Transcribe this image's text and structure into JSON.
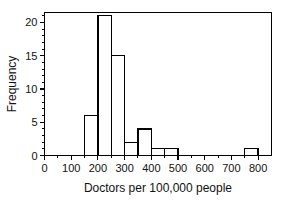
{
  "chart_data": {
    "type": "bar",
    "title": "",
    "subtitle": "",
    "xlabel": "Doctors per 100,000 people",
    "ylabel": "Frequency",
    "xlim": [
      0,
      850
    ],
    "ylim": [
      0,
      21.5
    ],
    "grid": false,
    "legend": null,
    "bin_width": 50,
    "xticks": [
      0,
      100,
      200,
      300,
      400,
      500,
      600,
      700,
      800
    ],
    "xtick_labels": [
      "0",
      "100",
      "200",
      "300",
      "400",
      "500",
      "600",
      "700",
      "800"
    ],
    "xticks_minor": [
      50,
      150,
      250,
      350,
      450,
      550,
      650,
      750
    ],
    "yticks": [
      0,
      5,
      10,
      15,
      20
    ],
    "ytick_labels": [
      "0",
      "5",
      "10",
      "15",
      "20"
    ],
    "yticks_minor": [
      1,
      2,
      3,
      4,
      6,
      7,
      8,
      9,
      11,
      12,
      13,
      14,
      16,
      17,
      18,
      19,
      21
    ],
    "bins": [
      {
        "start": 150,
        "end": 200,
        "value": 6
      },
      {
        "start": 200,
        "end": 250,
        "value": 21
      },
      {
        "start": 250,
        "end": 300,
        "value": 15
      },
      {
        "start": 300,
        "end": 350,
        "value": 2
      },
      {
        "start": 350,
        "end": 400,
        "value": 4
      },
      {
        "start": 400,
        "end": 450,
        "value": 1
      },
      {
        "start": 450,
        "end": 500,
        "value": 1
      },
      {
        "start": 750,
        "end": 800,
        "value": 1
      }
    ],
    "categories": [
      "150-200",
      "200-250",
      "250-300",
      "300-350",
      "350-400",
      "400-450",
      "450-500",
      "750-800"
    ],
    "values": [
      6,
      21,
      15,
      2,
      4,
      1,
      1,
      1
    ],
    "colors": {
      "bar_fill": "#ffffff",
      "bar_stroke": "#000000",
      "axis": "#000000",
      "text": "#111111",
      "background": "#ffffff"
    }
  }
}
